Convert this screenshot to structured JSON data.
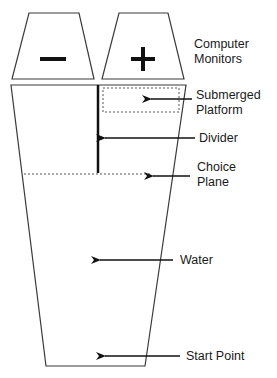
{
  "monitors": {
    "left_symbol": "−",
    "right_symbol": "+"
  },
  "labels": {
    "computer_monitors": [
      "Computer",
      "Monitors"
    ],
    "submerged_platform": [
      "Submerged",
      "Platform"
    ],
    "divider": "Divider",
    "choice_plane": [
      "Choice",
      "Plane"
    ],
    "water": "Water",
    "start_point": "Start Point"
  },
  "colors": {
    "line": "#3a3a3a",
    "heavy": "#111111",
    "dashed": "#555555",
    "background": "#ffffff"
  }
}
